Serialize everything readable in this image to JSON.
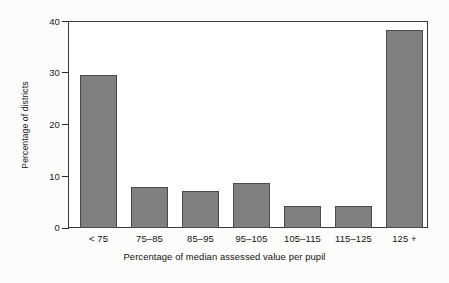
{
  "chart_data": {
    "type": "bar",
    "title": "",
    "xlabel": "Percentage of median assessed value per pupil",
    "ylabel": "Percentage of districts",
    "categories": [
      "< 75",
      "75–85",
      "85–95",
      "95–105",
      "105–115",
      "115–125",
      "125 +"
    ],
    "values": [
      29.6,
      7.9,
      7.2,
      8.6,
      4.2,
      4.2,
      38.2
    ],
    "ylim": [
      0,
      40
    ],
    "yticks": [
      0,
      10,
      20,
      30,
      40
    ],
    "ytick_labels": [
      "0",
      "10",
      "20",
      "30",
      "40"
    ],
    "grid": false,
    "legend": null,
    "bar_color": "#808080",
    "bar_edge_color": "#4a4a4a",
    "plot_background": "#ffffff",
    "figure_background": "#fcfcfa",
    "axis_color": "#1c1c1c"
  }
}
